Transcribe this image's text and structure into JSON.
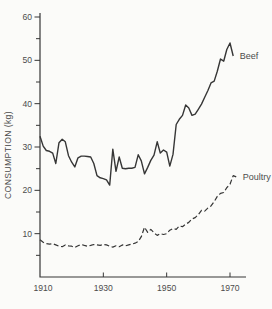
{
  "colors": {
    "background": "#fbfbf9",
    "line": "#363636",
    "text": "#4c4c4c"
  },
  "chart_data": {
    "type": "line",
    "title": "",
    "xlabel": "",
    "ylabel": "CONSUMPTION (kg)",
    "x_range": [
      1910,
      1975
    ],
    "y_range": [
      0,
      60
    ],
    "x_tick_labels": [
      1910,
      1930,
      1950,
      1970
    ],
    "x_tick_marks": [
      1930,
      1950,
      1970
    ],
    "y_tick_labels": [
      10,
      20,
      30,
      40,
      50,
      60
    ],
    "y_tick_minor": [
      5,
      15,
      25,
      35,
      45,
      55
    ],
    "grid": false,
    "legend_position": "inline-right-of-line-end",
    "series": [
      {
        "name": "Beef",
        "label": "Beef",
        "line_style": "solid",
        "x_start": 1910,
        "x_step": 1,
        "values": [
          32.5,
          30.2,
          29.2,
          29.0,
          28.6,
          26.2,
          31.0,
          31.8,
          31.2,
          28.0,
          26.5,
          25.4,
          27.5,
          27.9,
          27.9,
          27.8,
          27.7,
          26.2,
          23.4,
          22.9,
          22.7,
          22.4,
          21.2,
          29.5,
          24.4,
          27.7,
          25.1,
          25.0,
          25.1,
          25.1,
          25.3,
          28.2,
          26.8,
          23.8,
          25.3,
          26.9,
          28.1,
          31.2,
          28.6,
          29.3,
          28.8,
          25.6,
          28.3,
          35.2,
          36.4,
          37.3,
          39.7,
          39.0,
          37.3,
          37.6,
          38.7,
          39.9,
          41.5,
          43.0,
          44.8,
          45.2,
          47.5,
          50.3,
          49.8,
          52.5,
          54.0,
          51.0
        ]
      },
      {
        "name": "Poultry",
        "label": "Poultry",
        "line_style": "dashed",
        "x_start": 1910,
        "x_step": 1,
        "values": [
          8.6,
          8.0,
          7.7,
          7.6,
          7.7,
          7.4,
          7.1,
          7.0,
          7.4,
          7.2,
          7.1,
          6.8,
          7.2,
          7.5,
          7.3,
          7.1,
          7.3,
          7.5,
          7.4,
          7.3,
          7.5,
          7.4,
          7.1,
          6.9,
          7.2,
          7.0,
          7.4,
          7.2,
          7.4,
          7.6,
          7.8,
          8.2,
          9.3,
          11.5,
          10.3,
          11.0,
          10.2,
          9.6,
          10.0,
          9.8,
          10.0,
          10.8,
          11.2,
          11.0,
          11.8,
          11.6,
          12.2,
          12.6,
          13.4,
          13.7,
          14.4,
          15.4,
          15.2,
          15.9,
          16.4,
          17.4,
          18.6,
          19.3,
          19.5,
          20.6,
          21.4,
          23.4,
          23.1
        ]
      }
    ]
  }
}
